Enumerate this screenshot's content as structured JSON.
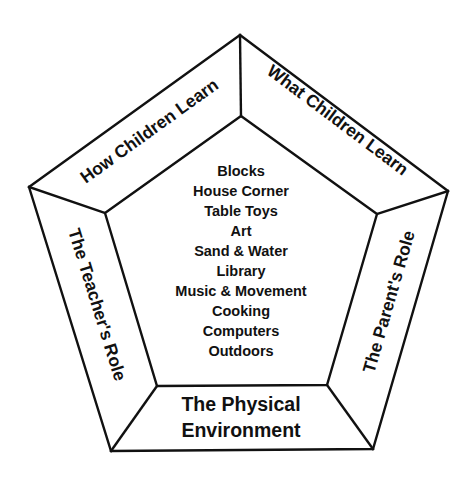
{
  "diagram": {
    "shape": "pentagon",
    "colors": {
      "line": "#111111",
      "text": "#111111",
      "background": "#ffffff"
    },
    "bands": {
      "top_left": {
        "label": "How Children Learn"
      },
      "top_right": {
        "label": "What Children Learn"
      },
      "left": {
        "label": "The Teacher's Role"
      },
      "right": {
        "label": "The Parent's Role"
      },
      "bottom": {
        "line1": "The Physical",
        "line2": "Environment"
      }
    },
    "center": {
      "items": [
        "Blocks",
        "House Corner",
        "Table Toys",
        "Art",
        "Sand & Water",
        "Library",
        "Music & Movement",
        "Cooking",
        "Computers",
        "Outdoors"
      ]
    }
  }
}
